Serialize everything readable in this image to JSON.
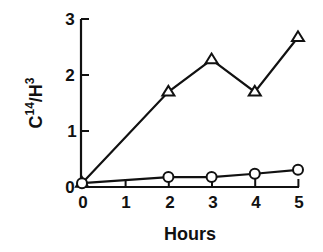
{
  "chart_data": {
    "type": "line",
    "title": "",
    "xlabel": "Hours",
    "ylabel": "C14/H3",
    "ylabel_parts": {
      "c": "C",
      "c_sup": "14",
      "slash": "/",
      "h": "H",
      "h_sup": "3"
    },
    "x": [
      0,
      2,
      3,
      4,
      5
    ],
    "xticks": [
      "0",
      "1",
      "2",
      "3",
      "4",
      "5"
    ],
    "yticks": [
      "0",
      "1",
      "2",
      "3"
    ],
    "xlim": [
      0,
      5
    ],
    "ylim": [
      0,
      3
    ],
    "grid": false,
    "legend": "none",
    "series": [
      {
        "name": "triangles",
        "marker": "triangle",
        "values": [
          0.05,
          1.69,
          2.27,
          1.69,
          2.67
        ]
      },
      {
        "name": "circles",
        "marker": "circle",
        "values": [
          0.05,
          0.16,
          0.16,
          0.22,
          0.29
        ]
      }
    ]
  },
  "colors": {
    "line": "#111111",
    "background": "#ffffff"
  }
}
